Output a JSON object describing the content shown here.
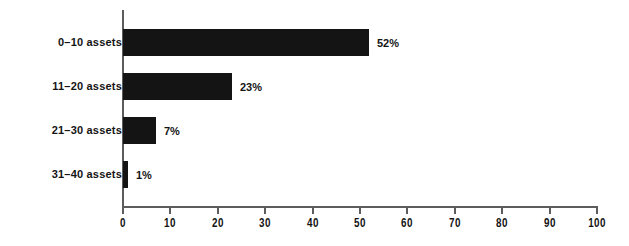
{
  "chart_data": {
    "type": "bar",
    "orientation": "horizontal",
    "title": "",
    "subtitle": "",
    "xlabel": "",
    "ylabel": "",
    "categories": [
      "0–10 assets",
      "11–20 assets",
      "21–30 assets",
      "31–40 assets"
    ],
    "values": [
      52,
      23,
      7,
      1
    ],
    "data_labels": [
      "52%",
      "23%",
      "7%",
      "1%"
    ],
    "xlim": [
      0,
      100
    ],
    "xticks": [
      0,
      10,
      20,
      30,
      40,
      50,
      60,
      70,
      80,
      90,
      100
    ],
    "xtick_labels": [
      "0",
      "10",
      "20",
      "30",
      "40",
      "50",
      "60",
      "70",
      "80",
      "90",
      "100"
    ],
    "grid": false,
    "legend": null,
    "colors": {
      "bar": "#141414",
      "axis": "#5c5c5c",
      "text": "#141414",
      "background": "#ffffff"
    }
  }
}
